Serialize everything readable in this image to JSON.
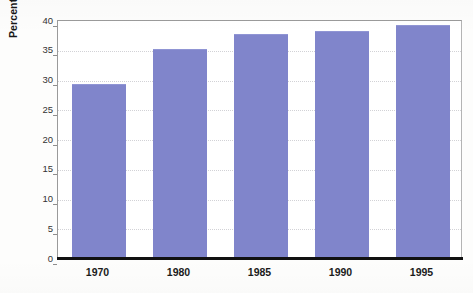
{
  "chart_data": {
    "type": "bar",
    "title": "",
    "subtitle": "",
    "xlabel": "",
    "ylabel": "Percentage of unmarried people over 18",
    "categories": [
      "1970",
      "1980",
      "1985",
      "1990",
      "1995"
    ],
    "values": [
      29,
      35,
      37.5,
      38,
      39
    ],
    "series": [
      {
        "name": "Percentage of unmarried people over 18",
        "values": [
          29,
          35,
          37.5,
          38,
          39
        ]
      }
    ],
    "ylim": [
      0,
      40
    ],
    "y_ticks": [
      0,
      5,
      10,
      15,
      20,
      25,
      30,
      35,
      40
    ],
    "y_tick_labels": [
      "0",
      "5",
      "10",
      "15",
      "20",
      "25",
      "30",
      "35",
      "40"
    ],
    "x_tick_labels": [
      "1970",
      "1980",
      "1985",
      "1990",
      "1995"
    ],
    "grid": true,
    "grid_axis": "y",
    "legend": false,
    "legend_position": "none",
    "bar_color": "#8085cb",
    "axis_color": "#111111",
    "gridline_color": "#d2d2d6",
    "plot_background": "#ffffff",
    "page_background": "#fdfdfc"
  }
}
